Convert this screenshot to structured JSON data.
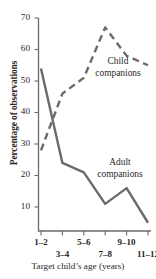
{
  "figure": {
    "cropped_top_fragment": "     ",
    "axis_color": "#6e6a68",
    "line_color": "#6e6a68",
    "text_color": "#2b2726"
  },
  "chart_data": {
    "type": "line",
    "title": "",
    "xlabel": "Target child’s age (years)",
    "ylabel": "Percentage of observations",
    "categories": [
      "1–2",
      "3–4",
      "5–6",
      "7–8",
      "9–10",
      "11–12"
    ],
    "ylim": [
      0,
      70
    ],
    "yticks": [
      10,
      20,
      30,
      40,
      50,
      60,
      70
    ],
    "ytick_labels": [
      "10",
      "20",
      "30",
      "40",
      "50",
      "60",
      "70"
    ],
    "grid": false,
    "legend": "inline-annotations",
    "series": [
      {
        "name": "Child companions",
        "label_lines": [
          "Child",
          "companions"
        ],
        "style": "dashed",
        "color": "#6e6a68",
        "values": [
          28,
          46,
          51,
          67,
          58,
          55
        ]
      },
      {
        "name": "Adult companions",
        "label_lines": [
          "Adult",
          "companions"
        ],
        "style": "solid",
        "color": "#6e6a68",
        "values": [
          54,
          24,
          21,
          11,
          16,
          5
        ]
      }
    ]
  }
}
